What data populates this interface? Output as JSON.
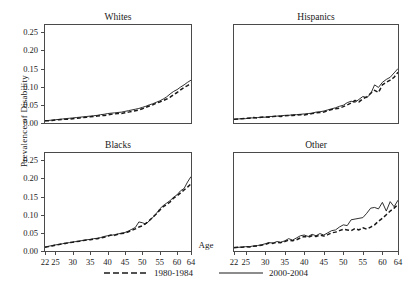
{
  "chart_data": {
    "type": "line",
    "title": "",
    "xlabel": "Age",
    "ylabel": "Prevalence of Disability",
    "xlim": [
      22,
      64
    ],
    "ylim": [
      0.0,
      0.27
    ],
    "xticks": [
      22,
      25,
      30,
      35,
      40,
      45,
      50,
      55,
      60,
      64
    ],
    "xtick_labels": [
      "22",
      "25",
      "30",
      "35",
      "40",
      "45",
      "50",
      "55",
      "60",
      "64"
    ],
    "yticks": [
      0.0,
      0.05,
      0.1,
      0.15,
      0.2,
      0.25
    ],
    "ytick_labels": [
      "0.00",
      "0.05",
      "0.10",
      "0.15",
      "0.20",
      "0.25"
    ],
    "grid": false,
    "legend_position": "bottom",
    "legend": [
      {
        "name": "1980-1984",
        "style": "dashed",
        "color": "#1a1a1a"
      },
      {
        "name": "2000-2004",
        "style": "solid",
        "color": "#1a1a1a"
      }
    ],
    "x": [
      22,
      23,
      24,
      25,
      26,
      27,
      28,
      29,
      30,
      31,
      32,
      33,
      34,
      35,
      36,
      37,
      38,
      39,
      40,
      41,
      42,
      43,
      44,
      45,
      46,
      47,
      48,
      49,
      50,
      51,
      52,
      53,
      54,
      55,
      56,
      57,
      58,
      59,
      60,
      61,
      62,
      63,
      64
    ],
    "panels": [
      {
        "title": "Whites",
        "series": [
          {
            "name": "1980-1984",
            "style": "dashed",
            "values": [
              0.006,
              0.006,
              0.007,
              0.008,
              0.009,
              0.01,
              0.01,
              0.011,
              0.012,
              0.013,
              0.014,
              0.015,
              0.016,
              0.017,
              0.018,
              0.019,
              0.02,
              0.021,
              0.022,
              0.024,
              0.025,
              0.026,
              0.026,
              0.028,
              0.03,
              0.032,
              0.034,
              0.036,
              0.039,
              0.043,
              0.047,
              0.05,
              0.055,
              0.058,
              0.062,
              0.066,
              0.071,
              0.078,
              0.084,
              0.091,
              0.098,
              0.103,
              0.11
            ]
          },
          {
            "name": "2000-2004",
            "style": "solid",
            "values": [
              0.006,
              0.007,
              0.008,
              0.009,
              0.01,
              0.011,
              0.012,
              0.013,
              0.014,
              0.015,
              0.016,
              0.017,
              0.018,
              0.019,
              0.02,
              0.021,
              0.023,
              0.024,
              0.026,
              0.027,
              0.028,
              0.029,
              0.03,
              0.032,
              0.034,
              0.036,
              0.038,
              0.04,
              0.043,
              0.046,
              0.05,
              0.053,
              0.057,
              0.061,
              0.066,
              0.072,
              0.08,
              0.087,
              0.092,
              0.099,
              0.105,
              0.112,
              0.118
            ]
          }
        ]
      },
      {
        "title": "Hispanics",
        "series": [
          {
            "name": "1980-1984",
            "style": "dashed",
            "values": [
              0.01,
              0.011,
              0.012,
              0.013,
              0.013,
              0.015,
              0.014,
              0.016,
              0.017,
              0.016,
              0.018,
              0.019,
              0.018,
              0.02,
              0.021,
              0.021,
              0.022,
              0.023,
              0.022,
              0.024,
              0.026,
              0.028,
              0.029,
              0.03,
              0.034,
              0.037,
              0.039,
              0.041,
              0.045,
              0.05,
              0.055,
              0.062,
              0.058,
              0.067,
              0.072,
              0.082,
              0.09,
              0.084,
              0.105,
              0.112,
              0.118,
              0.126,
              0.14
            ]
          },
          {
            "name": "2000-2004",
            "style": "solid",
            "values": [
              0.01,
              0.011,
              0.012,
              0.012,
              0.014,
              0.014,
              0.015,
              0.016,
              0.016,
              0.018,
              0.018,
              0.019,
              0.02,
              0.021,
              0.021,
              0.023,
              0.023,
              0.024,
              0.025,
              0.026,
              0.027,
              0.03,
              0.031,
              0.033,
              0.036,
              0.039,
              0.042,
              0.046,
              0.049,
              0.056,
              0.06,
              0.057,
              0.065,
              0.073,
              0.07,
              0.08,
              0.105,
              0.098,
              0.112,
              0.12,
              0.126,
              0.138,
              0.15
            ]
          }
        ]
      },
      {
        "title": "Blacks",
        "series": [
          {
            "name": "1980-1984",
            "style": "dashed",
            "values": [
              0.01,
              0.012,
              0.014,
              0.016,
              0.018,
              0.02,
              0.021,
              0.023,
              0.024,
              0.026,
              0.027,
              0.029,
              0.03,
              0.031,
              0.033,
              0.034,
              0.036,
              0.038,
              0.041,
              0.044,
              0.043,
              0.046,
              0.048,
              0.049,
              0.053,
              0.057,
              0.061,
              0.066,
              0.069,
              0.076,
              0.084,
              0.093,
              0.102,
              0.112,
              0.122,
              0.128,
              0.135,
              0.146,
              0.152,
              0.16,
              0.168,
              0.176,
              0.185
            ]
          },
          {
            "name": "2000-2004",
            "style": "solid",
            "values": [
              0.011,
              0.013,
              0.015,
              0.017,
              0.018,
              0.02,
              0.022,
              0.023,
              0.025,
              0.026,
              0.028,
              0.029,
              0.031,
              0.032,
              0.034,
              0.035,
              0.037,
              0.04,
              0.042,
              0.043,
              0.045,
              0.047,
              0.049,
              0.051,
              0.055,
              0.06,
              0.065,
              0.08,
              0.078,
              0.074,
              0.083,
              0.092,
              0.103,
              0.116,
              0.125,
              0.132,
              0.139,
              0.148,
              0.155,
              0.166,
              0.172,
              0.19,
              0.205
            ]
          }
        ]
      },
      {
        "title": "Other",
        "series": [
          {
            "name": "1980-1984",
            "style": "dashed",
            "values": [
              0.009,
              0.01,
              0.01,
              0.012,
              0.011,
              0.013,
              0.014,
              0.016,
              0.018,
              0.022,
              0.021,
              0.024,
              0.023,
              0.026,
              0.03,
              0.028,
              0.031,
              0.036,
              0.04,
              0.038,
              0.042,
              0.04,
              0.044,
              0.041,
              0.045,
              0.05,
              0.052,
              0.056,
              0.06,
              0.058,
              0.056,
              0.062,
              0.058,
              0.064,
              0.06,
              0.066,
              0.072,
              0.082,
              0.09,
              0.1,
              0.11,
              0.118,
              0.128
            ]
          },
          {
            "name": "2000-2004",
            "style": "solid",
            "values": [
              0.01,
              0.01,
              0.011,
              0.012,
              0.012,
              0.014,
              0.015,
              0.017,
              0.02,
              0.023,
              0.022,
              0.026,
              0.024,
              0.028,
              0.034,
              0.03,
              0.036,
              0.042,
              0.044,
              0.04,
              0.046,
              0.042,
              0.048,
              0.044,
              0.05,
              0.056,
              0.058,
              0.066,
              0.072,
              0.07,
              0.086,
              0.088,
              0.09,
              0.092,
              0.104,
              0.118,
              0.12,
              0.116,
              0.134,
              0.11,
              0.136,
              0.122,
              0.14
            ]
          }
        ]
      }
    ]
  },
  "legend": {
    "items": [
      {
        "label": "1980-1984",
        "style": "dashed"
      },
      {
        "label": "2000-2004",
        "style": "solid"
      }
    ]
  },
  "axes": {
    "xlabel": "Age",
    "ylabel": "Prevalence of Disability"
  }
}
